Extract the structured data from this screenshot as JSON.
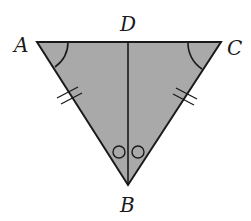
{
  "diagram": {
    "type": "geometry-triangle",
    "fill_color": "#a9a9a9",
    "stroke_color": "#1a1a1a",
    "labels": {
      "A": "A",
      "B": "B",
      "C": "C",
      "D": "D"
    },
    "segments": [
      "AC",
      "AB",
      "CB",
      "DB"
    ],
    "markings": {
      "congruent_angles_arc": [
        "A",
        "C"
      ],
      "congruent_sides_double_tick": [
        "AB",
        "CB"
      ],
      "congruent_angles_circle": [
        "ABD",
        "DBC"
      ]
    }
  }
}
